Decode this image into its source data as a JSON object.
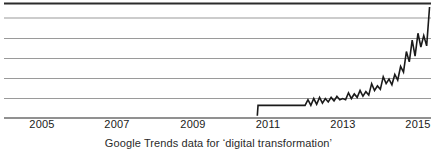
{
  "chart_data": {
    "type": "line",
    "title": "",
    "caption": "Google Trends data for ‘digital transformation’",
    "xlabel": "",
    "ylabel": "",
    "xlim": [
      2004.0,
      2015.8
    ],
    "ylim": [
      0,
      100
    ],
    "grid": true,
    "gridlines_y": [
      100,
      85,
      70,
      55,
      40,
      25,
      10
    ],
    "legend": null,
    "x_tick_labels": [
      "2005",
      "2007",
      "2009",
      "2011",
      "2013",
      "2015"
    ],
    "x_tick_values": [
      2005,
      2007,
      2009,
      2011,
      2013,
      2015
    ],
    "y_tick_labels": [],
    "series": [
      {
        "name": "digital transformation",
        "color": "#1a1a1a",
        "x": [
          2011.0,
          2011.02,
          2011.18,
          2011.35,
          2011.52,
          2011.68,
          2011.85,
          2012.0,
          2012.08,
          2012.16,
          2012.24,
          2012.32,
          2012.4,
          2012.48,
          2012.56,
          2012.64,
          2012.72,
          2012.8,
          2012.88,
          2012.96,
          2013.04,
          2013.12,
          2013.2,
          2013.28,
          2013.36,
          2013.44,
          2013.52,
          2013.6,
          2013.68,
          2013.76,
          2013.84,
          2013.92,
          2014.0,
          2014.08,
          2014.16,
          2014.24,
          2014.32,
          2014.4,
          2014.48,
          2014.56,
          2014.64,
          2014.72,
          2014.8,
          2014.88,
          2014.96,
          2015.04,
          2015.12,
          2015.2,
          2015.28,
          2015.36,
          2015.44,
          2015.52,
          2015.6,
          2015.68,
          2015.76
        ],
        "y": [
          2,
          11,
          11,
          11,
          11,
          11,
          11,
          11,
          11,
          11,
          11,
          11,
          16,
          11,
          17,
          12,
          18,
          13,
          17,
          14,
          18,
          15,
          19,
          16,
          17,
          16,
          22,
          17,
          21,
          18,
          24,
          19,
          23,
          20,
          30,
          24,
          28,
          25,
          36,
          30,
          34,
          29,
          38,
          33,
          45,
          40,
          58,
          49,
          68,
          54,
          74,
          62,
          72,
          63,
          97
        ]
      }
    ],
    "annotations": []
  },
  "figure": {
    "caption": "Google Trends data for ‘digital transformation’",
    "axis_color": "#2b2b2b",
    "grid_color": "#9a9a9a",
    "line_color": "#1a1a1a",
    "background": "#ffffff"
  },
  "ticks": [
    {
      "label": "2005",
      "x_px": 42
    },
    {
      "label": "2007",
      "x_px": 117
    },
    {
      "label": "2009",
      "x_px": 193
    },
    {
      "label": "2011",
      "x_px": 268
    },
    {
      "label": "2013",
      "x_px": 343
    },
    {
      "label": "2015",
      "x_px": 418
    }
  ]
}
